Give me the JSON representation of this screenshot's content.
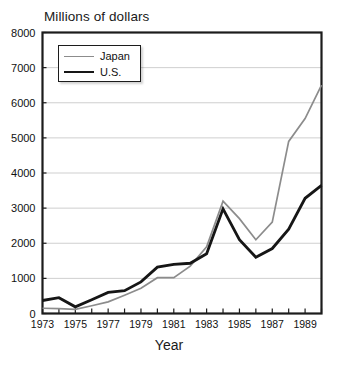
{
  "chart_data": {
    "type": "line",
    "title": "Millions of dollars",
    "xlabel": "Year",
    "ylabel": "",
    "xlim": [
      1973,
      1990
    ],
    "ylim": [
      0,
      8000
    ],
    "grid": true,
    "legend_position": "top-left",
    "y_ticks": [
      0,
      1000,
      2000,
      3000,
      4000,
      5000,
      6000,
      7000,
      8000
    ],
    "y_tick_labels": [
      "0",
      "1000",
      "2000",
      "3000",
      "4000",
      "5000",
      "6000",
      "7000",
      "8000"
    ],
    "x_ticks": [
      1973,
      1974,
      1975,
      1976,
      1977,
      1978,
      1979,
      1980,
      1981,
      1982,
      1983,
      1984,
      1985,
      1986,
      1987,
      1988,
      1989,
      1990
    ],
    "x_tick_labels": [
      "1973",
      "",
      "1975",
      "",
      "1977",
      "",
      "1979",
      "",
      "1981",
      "",
      "1983",
      "",
      "1985",
      "",
      "1987",
      "",
      "1989",
      ""
    ],
    "x": [
      1973,
      1974,
      1975,
      1976,
      1977,
      1978,
      1979,
      1980,
      1981,
      1982,
      1983,
      1984,
      1985,
      1986,
      1987,
      1988,
      1989,
      1990
    ],
    "series": [
      {
        "name": "Japan",
        "color": "#8c8c8c",
        "width": 1.7,
        "values": [
          150,
          140,
          120,
          220,
          330,
          520,
          720,
          1020,
          1020,
          1350,
          1900,
          3200,
          2700,
          2100,
          2600,
          4900,
          5550,
          6500
        ]
      },
      {
        "name": "U.S.",
        "color": "#161616",
        "width": 2.8,
        "values": [
          370,
          450,
          190,
          390,
          600,
          650,
          900,
          1320,
          1400,
          1430,
          1700,
          2980,
          2100,
          1600,
          1850,
          2400,
          3280,
          3650
        ]
      }
    ]
  },
  "legend": {
    "items": [
      {
        "label": "Japan"
      },
      {
        "label": "U.S."
      }
    ]
  }
}
